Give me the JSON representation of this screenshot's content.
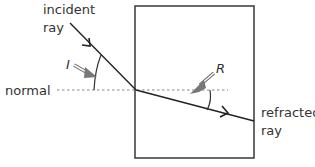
{
  "diagram": {
    "labels": {
      "incident_line1": "incident",
      "incident_line2": "ray",
      "angle_incidence": "I",
      "normal": "normal",
      "angle_refraction": "R",
      "refracted_line1": "refracted",
      "refracted_line2": "ray"
    },
    "colors": {
      "line": "#333333",
      "normal": "#888888",
      "arrow_fill": "#777777"
    }
  }
}
